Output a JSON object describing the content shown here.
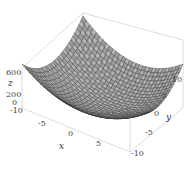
{
  "chart_data": {
    "type": "surface3d",
    "title": "",
    "function": "z = x^2 + y^2 (paraboloid bowl)",
    "xlabel": "x",
    "ylabel": "y",
    "zlabel": "z",
    "xlim": [
      -10,
      10
    ],
    "ylim": [
      -10,
      10
    ],
    "zlim": [
      0,
      600
    ],
    "x_ticks": [
      "-10",
      "-5",
      "0",
      "5"
    ],
    "y_ticks": [
      "-10",
      "-5",
      "0",
      "5",
      "10"
    ],
    "z_ticks": [
      "0",
      "200",
      "600"
    ],
    "grid_lines": 30,
    "surface_color": "#a9a9a9",
    "mesh_color": "#2a2a2a",
    "box_color": "#cfcfcf"
  }
}
